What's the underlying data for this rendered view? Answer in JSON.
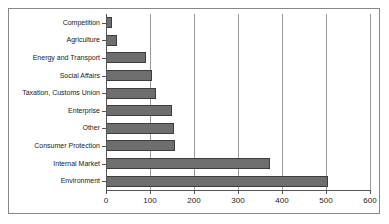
{
  "chart_data": {
    "type": "bar",
    "orientation": "horizontal",
    "title": "",
    "subtitle": "",
    "xlabel": "",
    "ylabel": "",
    "categories": [
      "Competition",
      "Agriculture",
      "Energy and Transport",
      "Social Affairs",
      "Taxation, Customs Union",
      "Enterprise",
      "Other",
      "Consumer Protection",
      "Internal Market",
      "Environment"
    ],
    "values": [
      13,
      25,
      90,
      104,
      113,
      150,
      155,
      157,
      372,
      505
    ],
    "xlim": [
      0,
      600
    ],
    "xticks": [
      0,
      100,
      200,
      300,
      400,
      500,
      600
    ],
    "xtick_labels": [
      "0",
      "100",
      "200",
      "300",
      "400",
      "500",
      "600"
    ],
    "grid": "vertical",
    "legend": "none",
    "bar_color": "#6e6e6e",
    "bar_edge_color": "#3d3d3d",
    "gridline_color": "#9a9a9a",
    "axis_color": "#555555",
    "frame_color": "#888888",
    "background": "#ffffff"
  }
}
